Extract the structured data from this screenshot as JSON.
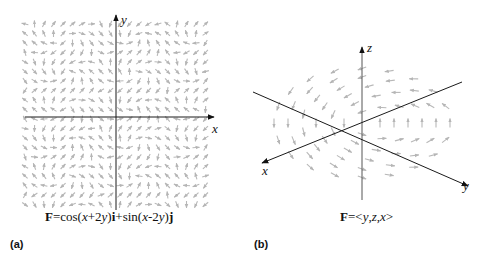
{
  "figure": {
    "panel_a": {
      "label": "(a)",
      "caption_parts": [
        "F",
        "=cos(",
        "x",
        "+2",
        "y",
        ")",
        "i",
        "+sin(",
        "x",
        "-2",
        "y",
        ")",
        "j"
      ],
      "axes": {
        "x": "x",
        "y": "y"
      },
      "field": "F=cos(x+2y)i+sin(x-2y)j",
      "type": "2D vector field"
    },
    "panel_b": {
      "label": "(b)",
      "caption_parts": [
        "F",
        "=<",
        "y",
        ",",
        "z",
        ",",
        "x",
        ">"
      ],
      "axes": {
        "x": "x",
        "y": "y",
        "z": "z"
      },
      "field": "F=<y,z,x>",
      "type": "3D vector field"
    },
    "colors": {
      "arrow": "#b8b8b8",
      "axis": "#1a1a1a"
    }
  }
}
